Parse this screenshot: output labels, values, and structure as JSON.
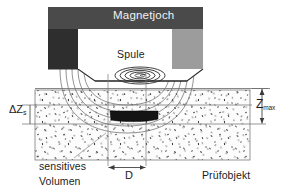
{
  "figure": {
    "title_text": "Magnetjoch"
  },
  "labels": {
    "magnetjoch": "Magnetjoch",
    "spule": "Spule",
    "delta_z_main": "ΔZ",
    "delta_z_sub": "s",
    "z_max_main": "Z",
    "z_max_sub": "max",
    "diameter": "D",
    "sensitives": "sensitives",
    "volumen": "Volumen",
    "pruefobjekt": "Prüfobjekt"
  },
  "colors": {
    "yoke_top": "#4a4a4a",
    "pole_left": "#2e2e2e",
    "pole_right": "#9c9c9c",
    "yoke_inner": "#ffffff",
    "defect": "#141414",
    "line": "#4d4d4d",
    "field_line": "#6b6b6b",
    "speckle": "#2a2a2a",
    "text_light": "#f2f2f2",
    "text_dark": "#1c1c1c",
    "background": "#ffffff",
    "specimen_fill": "#fcfcfc"
  },
  "geometry": {
    "yoke_top_bar": {
      "x": 48,
      "y": 7,
      "w": 155,
      "h": 22
    },
    "pole_left": {
      "x": 48,
      "y": 29,
      "w": 30,
      "h": 40
    },
    "pole_right": {
      "x": 172,
      "y": 29,
      "w": 31,
      "h": 40
    },
    "coil_center": {
      "cx": 140,
      "cy": 75,
      "rx": 25,
      "ry": 9
    },
    "coil_turns": 5,
    "specimen": {
      "x": 35,
      "y": 90,
      "w": 215,
      "h": 70
    },
    "defect": {
      "x": 110,
      "y": 111,
      "w": 48,
      "h": 10
    },
    "delta_z_band": {
      "top": 105,
      "bottom": 124
    },
    "z_max_span": {
      "top": 88,
      "bottom": 124
    },
    "diameter_span": {
      "left": 108,
      "right": 146,
      "y": 168
    },
    "specimen_surface_y": 88,
    "vertical_guide_left_x": 108,
    "vertical_guide_right_x": 146,
    "field_line_count": 5
  },
  "annotations": {
    "delta_z_description": "depth extent of the sensitive volume",
    "z_max_description": "maximum penetration depth below the surface",
    "d_description": "diameter of the sensitive volume at the surface"
  }
}
